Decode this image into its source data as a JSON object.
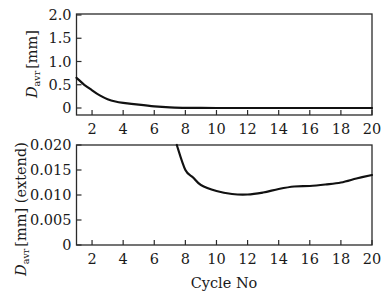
{
  "chart_data": [
    {
      "type": "line",
      "title": "",
      "xlabel": "",
      "ylabel": "D_avr [mm]",
      "ylabel_parts": {
        "symbol": "D",
        "subscript": "avr",
        "unit": "[mm]"
      },
      "xlim": [
        1,
        20
      ],
      "ylim": [
        0,
        2.0
      ],
      "x_ticks": [
        2,
        4,
        6,
        8,
        10,
        12,
        14,
        16,
        18,
        20
      ],
      "y_ticks": [
        0,
        0.5,
        1.0,
        1.5,
        2.0
      ],
      "y_tick_labels": [
        "0",
        "0.5",
        "1.0",
        "1.5",
        "2.0"
      ],
      "grid": false,
      "legend": null,
      "series": [
        {
          "name": "D_avr",
          "x": [
            1,
            1.5,
            2,
            2.5,
            3,
            3.5,
            4,
            5,
            6,
            7,
            8,
            9,
            10,
            12,
            14,
            16,
            18,
            20
          ],
          "y": [
            0.65,
            0.5,
            0.38,
            0.27,
            0.19,
            0.14,
            0.11,
            0.07,
            0.035,
            0.015,
            0.005,
            0.002,
            0.001,
            0.001,
            0.001,
            0.001,
            0.001,
            0.001
          ]
        }
      ]
    },
    {
      "type": "line",
      "title": "",
      "xlabel": "Cycle No",
      "ylabel": "D_avr [mm] (extend)",
      "ylabel_parts": {
        "symbol": "D",
        "subscript": "avr",
        "unit": "[mm] (extend)"
      },
      "xlim": [
        1,
        20
      ],
      "ylim": [
        0,
        0.02
      ],
      "x_ticks": [
        2,
        4,
        6,
        8,
        10,
        12,
        14,
        16,
        18,
        20
      ],
      "y_ticks": [
        0,
        0.005,
        0.01,
        0.015,
        0.02
      ],
      "y_tick_labels": [
        "0",
        "0.005",
        "0.010",
        "0.015",
        "0.020"
      ],
      "grid": false,
      "legend": null,
      "series": [
        {
          "name": "D_avr (extend)",
          "x": [
            7.45,
            8,
            8.5,
            9,
            10,
            11,
            12,
            13,
            14,
            15,
            16,
            17,
            18,
            19,
            20
          ],
          "y": [
            0.02,
            0.015,
            0.0135,
            0.012,
            0.0108,
            0.0102,
            0.0101,
            0.0105,
            0.0112,
            0.0117,
            0.0118,
            0.0121,
            0.0125,
            0.0133,
            0.014
          ]
        }
      ]
    }
  ],
  "colors": {
    "line": "#111111",
    "axes": "#2a2a2a",
    "background": "#ffffff"
  }
}
